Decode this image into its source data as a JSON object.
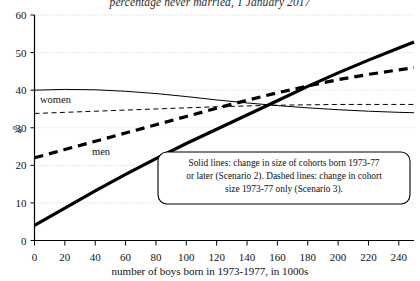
{
  "chart_data": {
    "type": "line",
    "title": "percentage never married, 1 January 2017",
    "xlabel": "number of boys born in 1973-1977, in 1000s",
    "ylabel": "%",
    "xlim": [
      0,
      250
    ],
    "ylim": [
      0,
      60
    ],
    "xticks": [
      0,
      20,
      40,
      60,
      80,
      100,
      120,
      140,
      160,
      180,
      200,
      220,
      240
    ],
    "yticks": [
      0,
      10,
      20,
      30,
      40,
      50,
      60
    ],
    "grid": "horizontal-dotted",
    "legend_position": "inline-labels",
    "annotations": [
      {
        "name": "scenario-note",
        "lines": [
          "Solid lines: change in size of cohorts born 1973-77",
          "or later (Scenario 2). Dashed lines: change in cohort",
          "size 1973-77 only (Scenario 3)."
        ]
      },
      {
        "name": "women-label",
        "text": "women",
        "x": 8,
        "y": 43
      },
      {
        "name": "men-label",
        "text": "men",
        "x": 70,
        "y": 23
      }
    ],
    "series": [
      {
        "name": "men-scenario-2",
        "label": "men",
        "style": "solid",
        "width": "thick",
        "color": "#000000",
        "x": [
          0,
          20,
          40,
          60,
          80,
          100,
          120,
          140,
          160,
          180,
          200,
          220,
          240,
          250
        ],
        "values": [
          4.0,
          8.6,
          13.2,
          17.6,
          21.8,
          25.8,
          29.6,
          33.4,
          37.2,
          41.0,
          44.6,
          48.0,
          51.2,
          52.8
        ]
      },
      {
        "name": "men-scenario-3",
        "label": "men",
        "style": "dashed",
        "width": "thick",
        "color": "#000000",
        "x": [
          0,
          20,
          40,
          60,
          80,
          100,
          120,
          140,
          160,
          180,
          200,
          220,
          240,
          250
        ],
        "values": [
          22.0,
          24.2,
          26.4,
          28.6,
          30.8,
          33.0,
          35.2,
          37.3,
          39.3,
          41.1,
          42.8,
          44.2,
          45.4,
          46.0
        ]
      },
      {
        "name": "women-scenario-2",
        "label": "women",
        "style": "solid",
        "width": "thin",
        "color": "#000000",
        "x": [
          0,
          20,
          40,
          60,
          80,
          100,
          120,
          140,
          160,
          180,
          200,
          220,
          240,
          250
        ],
        "values": [
          40.0,
          40.2,
          40.1,
          39.7,
          39.1,
          38.3,
          37.4,
          36.6,
          35.9,
          35.3,
          34.8,
          34.4,
          34.1,
          34.0
        ]
      },
      {
        "name": "women-scenario-3",
        "label": "women",
        "style": "dashed",
        "width": "thin",
        "color": "#000000",
        "x": [
          0,
          20,
          40,
          60,
          80,
          100,
          120,
          140,
          160,
          180,
          200,
          220,
          240,
          250
        ],
        "values": [
          33.8,
          34.1,
          34.4,
          34.7,
          35.0,
          35.3,
          35.6,
          35.8,
          36.0,
          36.1,
          36.2,
          36.2,
          36.2,
          36.2
        ]
      }
    ]
  }
}
